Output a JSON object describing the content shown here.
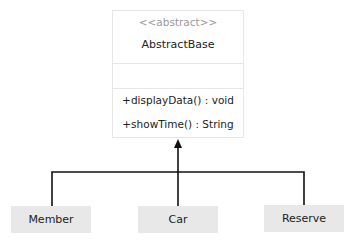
{
  "base_class": {
    "stereotype": "<<abstract>>",
    "name": "AbstractBase",
    "attributes": [],
    "operations": [
      "+displayData() : void",
      "+showTime() : String"
    ]
  },
  "subclasses": [
    {
      "name": "Member"
    },
    {
      "name": "Car"
    },
    {
      "name": "Reserve"
    }
  ],
  "relationship": "inheritance",
  "colors": {
    "line": "#111111",
    "subclass_fill": "#e8e8e8",
    "border": "#e6e6e6"
  }
}
